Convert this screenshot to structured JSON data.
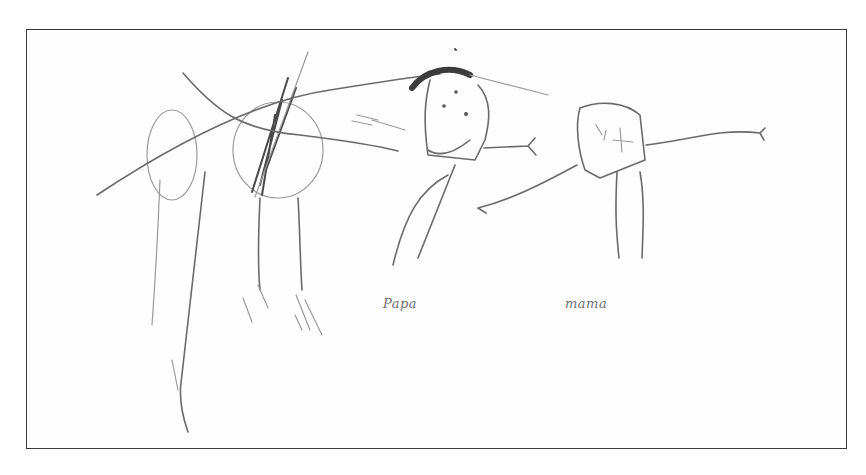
{
  "image": {
    "description": "Scanned child's pencil drawing of family figures inside a rectangular frame",
    "stroke_color": "#6a6a6a",
    "frame_color": "#3a3a3a",
    "background": "#ffffff"
  },
  "labels": {
    "papa": "Papa",
    "mama": "mama"
  },
  "figures": [
    {
      "name": "crossed-out-figure-left"
    },
    {
      "name": "crossed-out-figure-middle"
    },
    {
      "name": "papa"
    },
    {
      "name": "mama"
    }
  ]
}
